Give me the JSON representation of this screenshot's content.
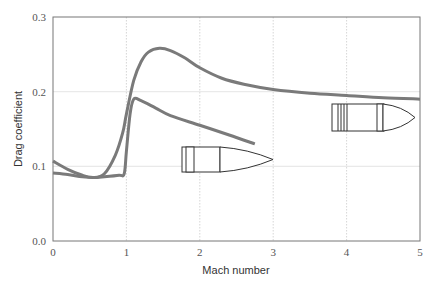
{
  "chart_data": {
    "type": "line",
    "title": "",
    "xlabel": "Mach number",
    "ylabel": "Drag coefficient",
    "xlim": [
      0,
      5
    ],
    "ylim": [
      0.0,
      0.3
    ],
    "xticks": [
      "0",
      "1",
      "2",
      "3",
      "4",
      "5"
    ],
    "yticks": [
      "0.0",
      "0.1",
      "0.2",
      "0.3"
    ],
    "grid": true,
    "legend": "none (series identified by bullet silhouettes)",
    "series": [
      {
        "name": "Long-range bullet (G7-type, boat-tail)",
        "x": [
          0.0,
          0.2,
          0.4,
          0.55,
          0.7,
          0.85,
          0.95,
          1.0,
          1.1,
          1.2,
          1.3,
          1.45,
          1.6,
          1.8,
          2.0,
          2.3,
          2.6,
          3.0,
          3.5,
          4.0,
          4.5,
          5.0
        ],
        "values": [
          0.107,
          0.096,
          0.088,
          0.085,
          0.09,
          0.115,
          0.145,
          0.17,
          0.215,
          0.24,
          0.253,
          0.258,
          0.255,
          0.245,
          0.232,
          0.218,
          0.21,
          0.203,
          0.198,
          0.195,
          0.192,
          0.19
        ]
      },
      {
        "name": "Flat-base bullet (G1-type)",
        "x": [
          0.0,
          0.2,
          0.4,
          0.55,
          0.7,
          0.9,
          0.97,
          1.0,
          1.05,
          1.1,
          1.2,
          1.4,
          1.6,
          2.0,
          2.4,
          2.75
        ],
        "values": [
          0.091,
          0.089,
          0.086,
          0.085,
          0.086,
          0.088,
          0.09,
          0.12,
          0.17,
          0.19,
          0.188,
          0.178,
          0.168,
          0.155,
          0.142,
          0.13
        ]
      }
    ]
  },
  "axes": {
    "xlabel": "Mach number",
    "ylabel": "Drag coefficient",
    "xticks": [
      "0",
      "1",
      "2",
      "3",
      "4",
      "5"
    ],
    "yticks": [
      "0.0",
      "0.1",
      "0.2",
      "0.3"
    ]
  },
  "colors": {
    "curve": "#7a7a7a",
    "grid": "#cccccc",
    "axis": "#666666",
    "bullet_outline": "#333333"
  }
}
